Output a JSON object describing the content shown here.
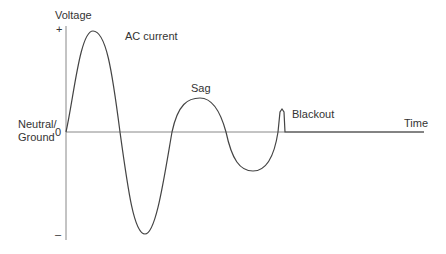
{
  "diagram": {
    "y_axis": {
      "label": "Voltage",
      "plus_label": "+",
      "zero_label": "0",
      "minus_label": "–",
      "neutral_label_line1": "Neutral/",
      "neutral_label_line2": "Ground"
    },
    "x_axis": {
      "label": "Time"
    },
    "annotations": {
      "ac_current": "AC current",
      "sag": "Sag",
      "blackout": "Blackout"
    },
    "colors": {
      "wave": "#444444",
      "axis": "#888888",
      "text": "#333333"
    }
  }
}
